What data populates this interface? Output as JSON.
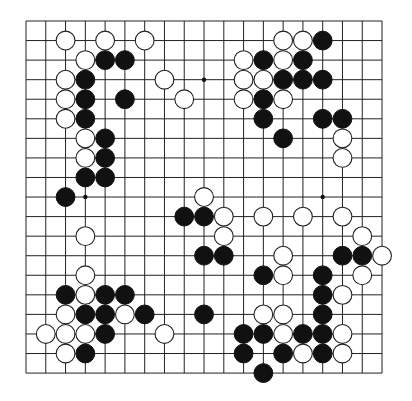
{
  "board": {
    "size": 19,
    "origin_x": 26,
    "origin_y": 21,
    "step_x": 19.78,
    "step_y": 19.56,
    "stone_radius": 9.4,
    "line_color": "#222222",
    "black_color": "#111111",
    "white_color": "#ffffff",
    "star_points": [
      [
        3,
        3
      ],
      [
        9,
        3
      ],
      [
        15,
        3
      ],
      [
        3,
        9
      ],
      [
        9,
        9
      ],
      [
        15,
        9
      ],
      [
        3,
        15
      ],
      [
        9,
        15
      ],
      [
        15,
        15
      ]
    ],
    "black_stones": [
      [
        4,
        2
      ],
      [
        5,
        2
      ],
      [
        3,
        3
      ],
      [
        3,
        4
      ],
      [
        5,
        4
      ],
      [
        3,
        5
      ],
      [
        4,
        6
      ],
      [
        4,
        7
      ],
      [
        3,
        8
      ],
      [
        4,
        8
      ],
      [
        2,
        9
      ],
      [
        15,
        1
      ],
      [
        12,
        2
      ],
      [
        14,
        2
      ],
      [
        13,
        3
      ],
      [
        14,
        3
      ],
      [
        15,
        3
      ],
      [
        12,
        4
      ],
      [
        12,
        5
      ],
      [
        15,
        5
      ],
      [
        16,
        5
      ],
      [
        13,
        6
      ],
      [
        8,
        10
      ],
      [
        9,
        10
      ],
      [
        9,
        12
      ],
      [
        10,
        12
      ],
      [
        16,
        12
      ],
      [
        17,
        12
      ],
      [
        12,
        13
      ],
      [
        15,
        13
      ],
      [
        15,
        14
      ],
      [
        9,
        15
      ],
      [
        15,
        15
      ],
      [
        11,
        16
      ],
      [
        12,
        16
      ],
      [
        14,
        16
      ],
      [
        15,
        16
      ],
      [
        11,
        17
      ],
      [
        13,
        17
      ],
      [
        15,
        17
      ],
      [
        12,
        18
      ],
      [
        2,
        14
      ],
      [
        4,
        14
      ],
      [
        5,
        14
      ],
      [
        3,
        15
      ],
      [
        4,
        15
      ],
      [
        6,
        15
      ],
      [
        4,
        16
      ],
      [
        3,
        17
      ]
    ],
    "white_stones": [
      [
        2,
        1
      ],
      [
        4,
        1
      ],
      [
        6,
        1
      ],
      [
        3,
        2
      ],
      [
        2,
        3
      ],
      [
        2,
        4
      ],
      [
        2,
        5
      ],
      [
        3,
        6
      ],
      [
        3,
        7
      ],
      [
        7,
        3
      ],
      [
        8,
        4
      ],
      [
        13,
        1
      ],
      [
        14,
        1
      ],
      [
        11,
        2
      ],
      [
        13,
        2
      ],
      [
        11,
        3
      ],
      [
        12,
        3
      ],
      [
        11,
        4
      ],
      [
        13,
        4
      ],
      [
        16,
        6
      ],
      [
        16,
        7
      ],
      [
        9,
        9
      ],
      [
        10,
        10
      ],
      [
        12,
        10
      ],
      [
        14,
        10
      ],
      [
        16,
        10
      ],
      [
        10,
        11
      ],
      [
        17,
        11
      ],
      [
        13,
        12
      ],
      [
        18,
        12
      ],
      [
        13,
        13
      ],
      [
        17,
        13
      ],
      [
        16,
        14
      ],
      [
        12,
        15
      ],
      [
        13,
        15
      ],
      [
        3,
        11
      ],
      [
        3,
        13
      ],
      [
        3,
        14
      ],
      [
        2,
        15
      ],
      [
        5,
        15
      ],
      [
        1,
        16
      ],
      [
        2,
        16
      ],
      [
        3,
        16
      ],
      [
        7,
        16
      ],
      [
        13,
        16
      ],
      [
        16,
        16
      ],
      [
        2,
        17
      ],
      [
        14,
        17
      ],
      [
        16,
        17
      ]
    ]
  }
}
